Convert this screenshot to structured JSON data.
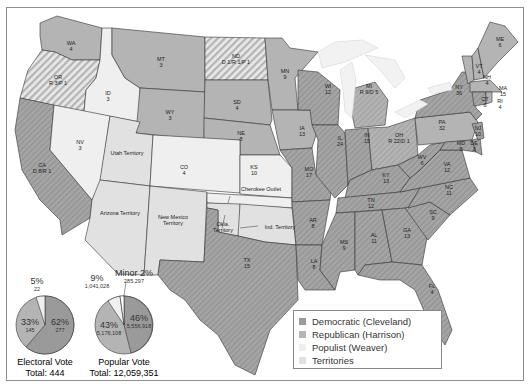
{
  "colors": {
    "democratic": "#9a9a9a",
    "republican": "#b4b4b4",
    "populist": "#efefef",
    "territories": "#e1e1e1",
    "water": "#ffffff",
    "border": "#333333"
  },
  "states": [
    {
      "abbr": "WA",
      "votes": "4",
      "party": "republican"
    },
    {
      "abbr": "OR",
      "votes": "R 3/P 1",
      "party": "split"
    },
    {
      "abbr": "CA",
      "votes": "D 8/R 1",
      "party": "split"
    },
    {
      "abbr": "ID",
      "votes": "3",
      "party": "populist"
    },
    {
      "abbr": "NV",
      "votes": "3",
      "party": "populist"
    },
    {
      "abbr": "MT",
      "votes": "3",
      "party": "republican"
    },
    {
      "abbr": "WY",
      "votes": "3",
      "party": "republican"
    },
    {
      "abbr": "CO",
      "votes": "4",
      "party": "populist"
    },
    {
      "abbr": "ND",
      "votes": "D 1/R 1/P 1",
      "party": "split"
    },
    {
      "abbr": "SD",
      "votes": "4",
      "party": "republican"
    },
    {
      "abbr": "NE",
      "votes": "8",
      "party": "republican"
    },
    {
      "abbr": "KS",
      "votes": "10",
      "party": "populist"
    },
    {
      "abbr": "MN",
      "votes": "9",
      "party": "republican"
    },
    {
      "abbr": "IA",
      "votes": "13",
      "party": "republican"
    },
    {
      "abbr": "MO",
      "votes": "17",
      "party": "democratic"
    },
    {
      "abbr": "AR",
      "votes": "8",
      "party": "democratic"
    },
    {
      "abbr": "LA",
      "votes": "8",
      "party": "democratic"
    },
    {
      "abbr": "TX",
      "votes": "15",
      "party": "democratic"
    },
    {
      "abbr": "WI",
      "votes": "12",
      "party": "democratic"
    },
    {
      "abbr": "IL",
      "votes": "24",
      "party": "democratic"
    },
    {
      "abbr": "MI",
      "votes": "R 9/D 5",
      "party": "split"
    },
    {
      "abbr": "IN",
      "votes": "15",
      "party": "democratic"
    },
    {
      "abbr": "OH",
      "votes": "R 22/D 1",
      "party": "split"
    },
    {
      "abbr": "KY",
      "votes": "13",
      "party": "democratic"
    },
    {
      "abbr": "TN",
      "votes": "12",
      "party": "democratic"
    },
    {
      "abbr": "MS",
      "votes": "9",
      "party": "democratic"
    },
    {
      "abbr": "AL",
      "votes": "11",
      "party": "democratic"
    },
    {
      "abbr": "GA",
      "votes": "13",
      "party": "democratic"
    },
    {
      "abbr": "FL",
      "votes": "4",
      "party": "democratic"
    },
    {
      "abbr": "SC",
      "votes": "9",
      "party": "democratic"
    },
    {
      "abbr": "NC",
      "votes": "11",
      "party": "democratic"
    },
    {
      "abbr": "VA",
      "votes": "12",
      "party": "democratic"
    },
    {
      "abbr": "WV",
      "votes": "6",
      "party": "democratic"
    },
    {
      "abbr": "MD",
      "votes": "8",
      "party": "democratic"
    },
    {
      "abbr": "DE",
      "votes": "3",
      "party": "democratic"
    },
    {
      "abbr": "NJ",
      "votes": "10",
      "party": "democratic"
    },
    {
      "abbr": "PA",
      "votes": "32",
      "party": "republican"
    },
    {
      "abbr": "NY",
      "votes": "36",
      "party": "democratic"
    },
    {
      "abbr": "VT",
      "votes": "4",
      "party": "republican"
    },
    {
      "abbr": "NH",
      "votes": "4",
      "party": "republican"
    },
    {
      "abbr": "ME",
      "votes": "6",
      "party": "republican"
    },
    {
      "abbr": "MA",
      "votes": "15",
      "party": "republican"
    },
    {
      "abbr": "CT",
      "votes": "6",
      "party": "democratic"
    },
    {
      "abbr": "RI",
      "votes": "4",
      "party": "republican"
    }
  ],
  "territories": [
    {
      "name": "Utah Territory"
    },
    {
      "name": "Arizona Territory"
    },
    {
      "name": "New Mexico Territory"
    },
    {
      "name": "Okla. Territory"
    },
    {
      "name": "Ind. Territory"
    },
    {
      "name": "Cherokee Outlet"
    }
  ],
  "electoral_pie": {
    "title": "Electoral Vote",
    "total": "Total: 444",
    "slices": [
      {
        "party": "democratic",
        "pct": "62%",
        "value": "277"
      },
      {
        "party": "republican",
        "pct": "33%",
        "value": "145"
      },
      {
        "party": "populist",
        "pct": "5%",
        "value": "22"
      }
    ]
  },
  "popular_pie": {
    "title": "Popular Vote",
    "total": "Total: 12,059,351",
    "slices": [
      {
        "party": "democratic",
        "pct": "46%",
        "value": "5,556,918"
      },
      {
        "party": "republican",
        "pct": "43%",
        "value": "5,176,108"
      },
      {
        "party": "populist",
        "pct": "9%",
        "value": "1,041,028"
      },
      {
        "party": "minor",
        "pct": "Minor 2%",
        "value": "285,297"
      }
    ]
  },
  "legend": {
    "items": [
      {
        "label": "Democratic (Cleveland)",
        "color": "#9a9a9a"
      },
      {
        "label": "Republican (Harrison)",
        "color": "#b4b4b4"
      },
      {
        "label": "Populist (Weaver)",
        "color": "#efefef"
      },
      {
        "label": "Territories",
        "color": "#e1e1e1"
      }
    ]
  }
}
